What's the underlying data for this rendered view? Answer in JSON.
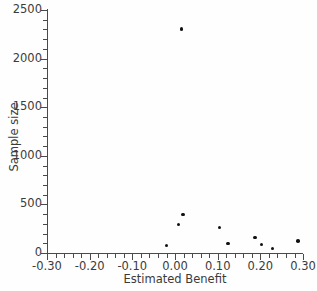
{
  "chart_data": {
    "type": "scatter",
    "title": "",
    "xlabel": "Estimated Benefit",
    "ylabel": "Sample size",
    "xlim": [
      -0.3,
      0.3
    ],
    "ylim": [
      0,
      2500
    ],
    "grid": false,
    "legend": null,
    "marker": "filled-circle",
    "marker_color": "#111111",
    "xticks": [
      -0.3,
      -0.2,
      -0.1,
      0.0,
      0.1,
      0.2,
      0.3
    ],
    "xticklabels": [
      "-0.30",
      "-0.20",
      "-0.10",
      "0.00",
      "0.10",
      "0.20",
      "0.30"
    ],
    "yticks": [
      0,
      500,
      1000,
      1500,
      2000,
      2500
    ],
    "yticklabels": [
      "0",
      "500",
      "1000",
      "1500",
      "2000",
      "2500"
    ],
    "x_minor_tick_interval": 0.02,
    "y_minor_tick_interval": 100,
    "points": [
      {
        "x": 0.015,
        "y": 2305
      },
      {
        "x": 0.019,
        "y": 395
      },
      {
        "x": 0.008,
        "y": 295
      },
      {
        "x": -0.02,
        "y": 75
      },
      {
        "x": 0.104,
        "y": 260
      },
      {
        "x": 0.124,
        "y": 100
      },
      {
        "x": 0.188,
        "y": 160
      },
      {
        "x": 0.203,
        "y": 90
      },
      {
        "x": 0.228,
        "y": 45
      },
      {
        "x": 0.288,
        "y": 125
      }
    ]
  },
  "axes": {
    "y_title": "Sample size",
    "x_title": "Estimated Benefit"
  },
  "colors": {
    "axis": "#4a4a4a",
    "text": "#3b3b3b",
    "marker": "#111111",
    "background": "#fefefe"
  }
}
